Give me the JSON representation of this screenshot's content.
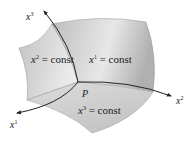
{
  "diagram": {
    "point_label": "P",
    "axes": [
      {
        "id": "x1",
        "base": "x",
        "sup": "1"
      },
      {
        "id": "x2",
        "base": "x",
        "sup": "2"
      },
      {
        "id": "x3",
        "base": "x",
        "sup": "3"
      }
    ],
    "surfaces": [
      {
        "id": "x2-const",
        "base": "x",
        "sup": "2",
        "rest": " = const"
      },
      {
        "id": "x1-const",
        "base": "x",
        "sup": "1",
        "rest": " = const"
      },
      {
        "id": "x3-const",
        "base": "x",
        "sup": "3",
        "rest": " = const"
      }
    ],
    "colors": {
      "surface_light": "#e6e6e6",
      "surface_dark": "#b8b8b8",
      "curve": "#222222",
      "edge": "#9a9a9a"
    }
  }
}
